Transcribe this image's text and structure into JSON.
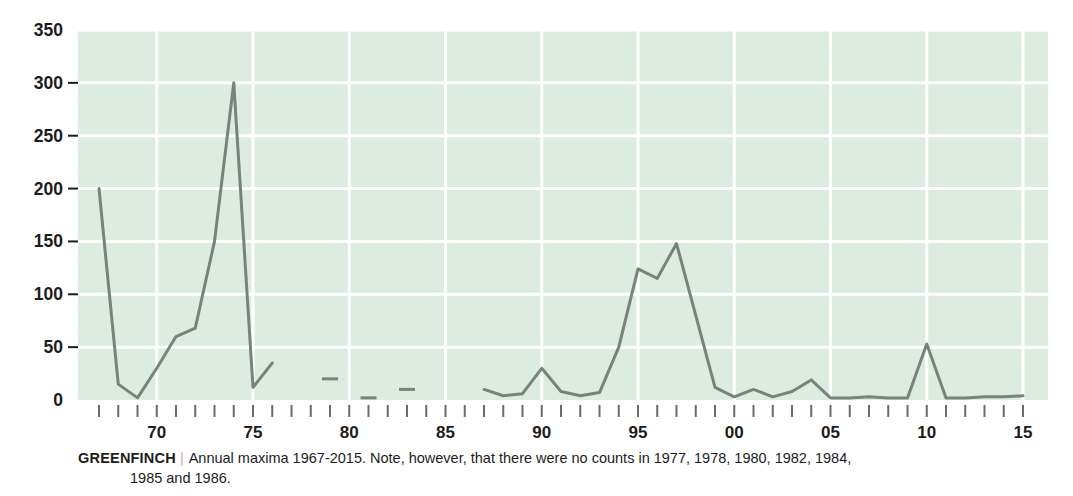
{
  "caption": {
    "series_name": "GREENFINCH",
    "divider": "|",
    "text": "Annual maxima 1967-2015. Note, however, that there were no counts in 1977, 1978, 1980, 1982, 1984,",
    "text_line2": "1985 and 1986."
  },
  "colors": {
    "plot_background": "#dcece1",
    "gridline": "#ffffff",
    "line": "#77837d",
    "axis_text": "#1c1c1c",
    "tick_mark": "#6b6b6b",
    "page_background": "#ffffff"
  },
  "chart_data": {
    "type": "line",
    "title": "",
    "xlabel": "",
    "ylabel": "",
    "xlim": [
      1966.5,
      2015.5
    ],
    "ylim": [
      0,
      350
    ],
    "grid": true,
    "legend": "none",
    "ytick_labels": [
      "0",
      "50",
      "100",
      "150",
      "200",
      "250",
      "300",
      "350"
    ],
    "ytick_values": [
      0,
      50,
      100,
      150,
      200,
      250,
      300,
      350
    ],
    "xtick_labels": [
      "70",
      "75",
      "80",
      "85",
      "90",
      "95",
      "00",
      "05",
      "10",
      "15"
    ],
    "xtick_label_years": [
      1970,
      1975,
      1980,
      1985,
      1990,
      1995,
      2000,
      2005,
      2010,
      2015
    ],
    "xtick_minor_years": [
      1967,
      1968,
      1969,
      1970,
      1971,
      1972,
      1973,
      1974,
      1975,
      1976,
      1977,
      1978,
      1979,
      1980,
      1981,
      1982,
      1983,
      1984,
      1985,
      1986,
      1987,
      1988,
      1989,
      1990,
      1991,
      1992,
      1993,
      1994,
      1995,
      1996,
      1997,
      1998,
      1999,
      2000,
      2001,
      2002,
      2003,
      2004,
      2005,
      2006,
      2007,
      2008,
      2009,
      2010,
      2011,
      2012,
      2013,
      2014,
      2015
    ],
    "missing_years": [
      1977,
      1978,
      1980,
      1982,
      1984,
      1985,
      1986
    ],
    "x": [
      1967,
      1968,
      1969,
      1970,
      1971,
      1972,
      1973,
      1974,
      1975,
      1976,
      1979,
      1981,
      1983,
      1987,
      1988,
      1989,
      1990,
      1991,
      1992,
      1993,
      1994,
      1995,
      1996,
      1997,
      1998,
      1999,
      2000,
      2001,
      2002,
      2003,
      2004,
      2005,
      2006,
      2007,
      2008,
      2009,
      2010,
      2011,
      2012,
      2013,
      2014,
      2015
    ],
    "values": [
      200,
      15,
      2,
      30,
      60,
      68,
      150,
      300,
      12,
      35,
      20,
      2,
      10,
      10,
      4,
      6,
      30,
      8,
      4,
      7,
      50,
      124,
      115,
      148,
      80,
      12,
      3,
      10,
      3,
      8,
      19,
      2,
      2,
      3,
      2,
      2,
      53,
      2,
      2,
      3,
      3,
      4
    ],
    "series": [
      {
        "name": "Greenfinch annual maxima",
        "points": [
          {
            "year": 1967,
            "value": 200
          },
          {
            "year": 1968,
            "value": 15
          },
          {
            "year": 1969,
            "value": 2
          },
          {
            "year": 1970,
            "value": 30
          },
          {
            "year": 1971,
            "value": 60
          },
          {
            "year": 1972,
            "value": 68
          },
          {
            "year": 1973,
            "value": 150
          },
          {
            "year": 1974,
            "value": 300
          },
          {
            "year": 1975,
            "value": 12
          },
          {
            "year": 1976,
            "value": 35
          },
          {
            "year": 1979,
            "value": 20
          },
          {
            "year": 1981,
            "value": 2
          },
          {
            "year": 1983,
            "value": 10
          },
          {
            "year": 1987,
            "value": 10
          },
          {
            "year": 1988,
            "value": 4
          },
          {
            "year": 1989,
            "value": 6
          },
          {
            "year": 1990,
            "value": 30
          },
          {
            "year": 1991,
            "value": 8
          },
          {
            "year": 1992,
            "value": 4
          },
          {
            "year": 1993,
            "value": 7
          },
          {
            "year": 1994,
            "value": 50
          },
          {
            "year": 1995,
            "value": 124
          },
          {
            "year": 1996,
            "value": 115
          },
          {
            "year": 1997,
            "value": 148
          },
          {
            "year": 1998,
            "value": 80
          },
          {
            "year": 1999,
            "value": 12
          },
          {
            "year": 2000,
            "value": 3
          },
          {
            "year": 2001,
            "value": 10
          },
          {
            "year": 2002,
            "value": 3
          },
          {
            "year": 2003,
            "value": 8
          },
          {
            "year": 2004,
            "value": 19
          },
          {
            "year": 2005,
            "value": 2
          },
          {
            "year": 2006,
            "value": 2
          },
          {
            "year": 2007,
            "value": 3
          },
          {
            "year": 2008,
            "value": 2
          },
          {
            "year": 2009,
            "value": 2
          },
          {
            "year": 2010,
            "value": 53
          },
          {
            "year": 2011,
            "value": 2
          },
          {
            "year": 2012,
            "value": 2
          },
          {
            "year": 2013,
            "value": 3
          },
          {
            "year": 2014,
            "value": 3
          },
          {
            "year": 2015,
            "value": 4
          }
        ],
        "segments": [
          [
            1967,
            1968,
            1969,
            1970,
            1971,
            1972,
            1973,
            1974,
            1975,
            1976
          ],
          [
            1979
          ],
          [
            1981
          ],
          [
            1983
          ],
          [
            1987,
            1988,
            1989,
            1990,
            1991,
            1992,
            1993,
            1994,
            1995,
            1996,
            1997,
            1998,
            1999,
            2000,
            2001,
            2002,
            2003,
            2004,
            2005,
            2006,
            2007,
            2008,
            2009,
            2010,
            2011,
            2012,
            2013,
            2014,
            2015
          ]
        ]
      }
    ]
  }
}
